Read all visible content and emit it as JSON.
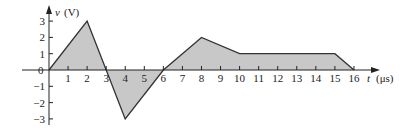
{
  "chart_data": {
    "type": "line",
    "title": "",
    "xlabel": "t (μs)",
    "ylabel": "v (V)",
    "x_ticks": [
      1,
      2,
      3,
      4,
      5,
      6,
      7,
      8,
      9,
      10,
      11,
      12,
      13,
      14,
      15,
      16
    ],
    "y_ticks": [
      3,
      2,
      1,
      0,
      -1,
      -2,
      -3
    ],
    "xlim": [
      0,
      16
    ],
    "ylim": [
      -3,
      3
    ],
    "fill_under_curve": true,
    "fill_color": "#c8c8c8",
    "line_color": "#333333",
    "points": [
      {
        "t": 0,
        "v": 0
      },
      {
        "t": 2,
        "v": 3
      },
      {
        "t": 3,
        "v": 0
      },
      {
        "t": 4,
        "v": -3
      },
      {
        "t": 6,
        "v": 0
      },
      {
        "t": 8,
        "v": 2
      },
      {
        "t": 10,
        "v": 1
      },
      {
        "t": 15,
        "v": 1
      },
      {
        "t": 16,
        "v": 0
      }
    ]
  },
  "labels": {
    "y_axis_var": "v",
    "y_axis_unit": "(V)",
    "x_axis_var": "t",
    "x_axis_unit": "(μs)",
    "origin": "0"
  }
}
